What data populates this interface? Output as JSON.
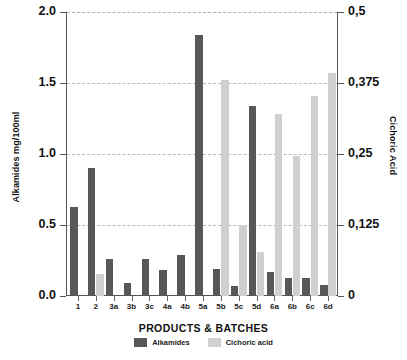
{
  "chart_data": {
    "type": "bar",
    "title": "",
    "xlabel": "PRODUCTS & BATCHES",
    "ylabel": "Alkamides mg/100ml",
    "ylabel_right": "Cichoric Acid",
    "categories": [
      "1",
      "2",
      "3a",
      "3b",
      "3c",
      "4a",
      "4b",
      "5a",
      "5b",
      "5c",
      "5d",
      "6a",
      "6b",
      "6c",
      "6d"
    ],
    "series": [
      {
        "name": "Alkamides",
        "axis": "left",
        "color": "#585858",
        "values": [
          0.63,
          0.9,
          0.26,
          0.09,
          0.26,
          0.18,
          0.29,
          1.84,
          0.19,
          0.07,
          1.34,
          0.17,
          0.13,
          0.13,
          0.08
        ]
      },
      {
        "name": "Cichoric acid",
        "axis": "right",
        "color": "#d0d0d0",
        "values": [
          0,
          0.039,
          0,
          0,
          0,
          0,
          0,
          0,
          0.381,
          0.125,
          0.078,
          0.32,
          0.247,
          0.352,
          0.392
        ]
      }
    ],
    "left_axis": {
      "ticks": [
        "0.0",
        "0.5",
        "1.0",
        "1.5",
        "2.0"
      ],
      "values": [
        0.0,
        0.5,
        1.0,
        1.5,
        2.0
      ],
      "ylim": [
        0,
        2.0
      ]
    },
    "right_axis": {
      "ticks": [
        "0",
        "0,125",
        "0,25",
        "0,375",
        "0,5"
      ],
      "values": [
        0,
        0.125,
        0.25,
        0.375,
        0.5
      ],
      "ylim": [
        0,
        0.5
      ]
    },
    "grid": true,
    "legend_position": "bottom"
  },
  "legend": {
    "items": [
      {
        "label": "Alkamides"
      },
      {
        "label": "Cichoric acid"
      }
    ]
  }
}
